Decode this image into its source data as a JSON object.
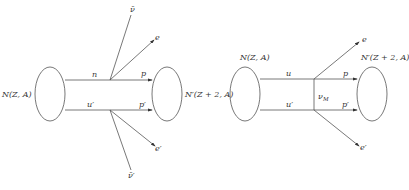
{
  "diagrams": [
    {
      "name": "two-neutrino-double-beta-decay",
      "nucleus_initial": "N(Z, A)",
      "nucleus_final": "N′(Z + 2, A)",
      "upper_in": "n",
      "upper_out": "p",
      "lower_in": "u′",
      "lower_out": "p′",
      "upper_lepton": "e",
      "upper_antineutrino": "ν̄",
      "lower_lepton": "e′",
      "lower_antineutrino": "ν̄′"
    },
    {
      "name": "neutrinoless-double-beta-decay",
      "nucleus_initial": "N(Z, A)",
      "nucleus_final": "N′(Z + 2, A)",
      "upper_in": "u",
      "upper_out": "p",
      "lower_in": "u′",
      "lower_out": "p′",
      "upper_lepton": "e",
      "lower_lepton": "e′",
      "exchange": "ν",
      "exchange_sub": "M"
    }
  ]
}
